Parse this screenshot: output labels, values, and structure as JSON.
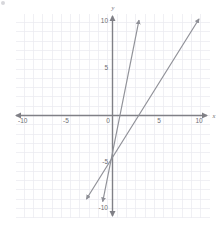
{
  "chart_data": {
    "type": "line",
    "title": "",
    "subtitle": "",
    "xlabel": "x",
    "ylabel": "y",
    "xlim": [
      -10,
      10
    ],
    "ylim": [
      -10,
      10
    ],
    "grid": true,
    "grid_step": 1,
    "legend": "none",
    "x_ticks": [
      -10,
      -5,
      5,
      10
    ],
    "y_ticks": [
      10,
      5,
      -5,
      -10
    ],
    "origin_label": "0",
    "x_tick_labels": [
      "-10",
      "-5",
      "5",
      "10"
    ],
    "y_tick_labels": [
      "10",
      "5",
      "-5",
      "-10"
    ],
    "axis_arrows": [
      "left",
      "right",
      "up",
      "down"
    ],
    "series": [
      {
        "name": "line-1",
        "equation": "y = 5x - 4",
        "slope": 5,
        "intercept": -4,
        "x_start": -1.05,
        "x_end": 2.85,
        "arrows": [
          "start",
          "end"
        ],
        "color": "#8f9097"
      },
      {
        "name": "line-2",
        "equation": "y = 1.6x - 4.5",
        "slope": 1.6,
        "intercept": -4.5,
        "x_start": -2.8,
        "x_end": 9.3,
        "arrows": [
          "start",
          "end"
        ],
        "color": "#8f9097"
      }
    ]
  },
  "colors": {
    "grid": "#e9e9f0",
    "axis": "#808086",
    "line": "#8f9097",
    "tick_text": "#6e6e72"
  },
  "labels": {
    "x_axis_name": "x",
    "y_axis_name": "y",
    "origin": "0",
    "x_neg10": "-10",
    "x_neg5": "-5",
    "x_pos5": "5",
    "x_pos10": "10",
    "y_pos10": "10",
    "y_pos5": "5",
    "y_neg5": "-5",
    "y_neg10": "-10"
  }
}
